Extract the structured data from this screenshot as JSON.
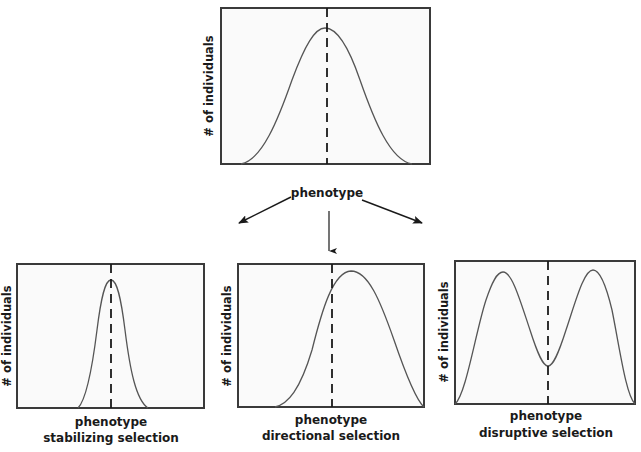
{
  "diagram": {
    "colors": {
      "frame": "#3a3a3a",
      "plot_bg": "#fafafa",
      "curve": "#555555",
      "dashed_line": "#1a1a1a",
      "arrow": "#1a1a1a",
      "text": "#1a1a1a"
    },
    "top_panel": {
      "ylabel": "# of individuals",
      "xlabel": "phenotype",
      "curve": "normal distribution centered on mean"
    },
    "arrows": [
      {
        "direction": "down-left",
        "target": "stabilizing"
      },
      {
        "direction": "down",
        "target": "directional"
      },
      {
        "direction": "down-right",
        "target": "disruptive"
      }
    ],
    "panels": [
      {
        "id": "stabilizing",
        "ylabel": "# of individuals",
        "xlabel": "phenotype",
        "caption": "stabilizing selection",
        "curve": "narrow peak centered on mean"
      },
      {
        "id": "directional",
        "ylabel": "# of individuals",
        "xlabel": "phenotype",
        "caption": "directional selection",
        "curve": "peak shifted right of original mean"
      },
      {
        "id": "disruptive",
        "ylabel": "# of individuals",
        "xlabel": "phenotype",
        "caption": "disruptive selection",
        "curve": "bimodal with dip at original mean"
      }
    ]
  }
}
